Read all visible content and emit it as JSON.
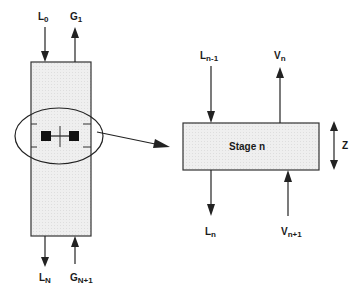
{
  "diagram": {
    "column": {
      "top_inflow": {
        "main": "L",
        "sub": "0"
      },
      "top_outflow": {
        "main": "G",
        "sub": "1"
      },
      "bottom_outflow": {
        "main": "L",
        "sub": "N"
      },
      "bottom_inflow": {
        "main": "G",
        "sub": "N+1"
      }
    },
    "stage": {
      "title": "Stage n",
      "liquid_in": {
        "main": "L",
        "sub": "n-1"
      },
      "vapor_out": {
        "main": "V",
        "sub": "n"
      },
      "liquid_out": {
        "main": "L",
        "sub": "n"
      },
      "vapor_in": {
        "main": "V",
        "sub": "n+1"
      },
      "height_axis": "Z"
    },
    "colors": {
      "box_fill": "#ececec",
      "stroke": "#333333"
    }
  }
}
